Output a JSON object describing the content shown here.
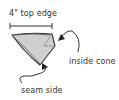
{
  "diagram": {
    "labels": {
      "top_edge": "4\" top edge",
      "inside_cone": "inside cone",
      "seam_side": "seam side"
    },
    "colors": {
      "line": "#333333",
      "fill": "#cfcfcf",
      "background": "#ffffff"
    },
    "shapes": {
      "cone": "folded-triangle-cone",
      "measurement_bracket": "4-inch-width-bracket",
      "arrows": [
        "arrow-to-inside-cone",
        "arrow-to-seam-side"
      ]
    }
  }
}
